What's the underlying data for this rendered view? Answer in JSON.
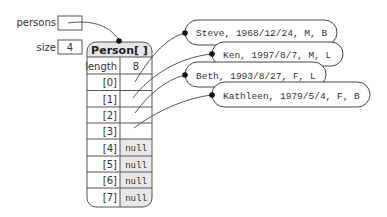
{
  "variables": {
    "persons": {
      "label": "persons",
      "value": ""
    },
    "size": {
      "label": "size",
      "value": "4"
    }
  },
  "array": {
    "title": "Person[ ]",
    "length_label": "length",
    "length_value": "8",
    "cells": [
      {
        "index": "[0]",
        "value": "",
        "ref": "Steve"
      },
      {
        "index": "[1]",
        "value": "",
        "ref": "Ken"
      },
      {
        "index": "[2]",
        "value": "",
        "ref": "Beth"
      },
      {
        "index": "[3]",
        "value": "",
        "ref": "Kathleen"
      },
      {
        "index": "[4]",
        "value": "null"
      },
      {
        "index": "[5]",
        "value": "null"
      },
      {
        "index": "[6]",
        "value": "null"
      },
      {
        "index": "[7]",
        "value": "null"
      }
    ]
  },
  "objects": [
    {
      "text": "Steve, 1968/12/24, M, B"
    },
    {
      "text": "Ken, 1997/8/7, M, L"
    },
    {
      "text": "Beth, 1993/8/27, F, L"
    },
    {
      "text": "Kathleen, 1979/5/4, F, B"
    }
  ],
  "colors": {
    "header_fill": "#e6e6e6",
    "null_fill": "#e8e8e8",
    "stroke": "#555555"
  }
}
